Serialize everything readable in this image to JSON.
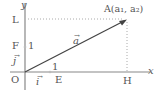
{
  "diagram": {
    "type": "coordinate-plane-vector",
    "axes": {
      "x_label": "x",
      "y_label": "y",
      "origin_label": "O",
      "axis_color": "#888888"
    },
    "points": {
      "L": "L",
      "F": "F",
      "E": "E",
      "H": "H",
      "A": "A(a₁, a₂)"
    },
    "unit_labels": {
      "y_unit": "1",
      "x_unit": "1"
    },
    "vectors": {
      "a": "a",
      "i": "i",
      "j": "j",
      "arrow_glyph": "→"
    },
    "colors": {
      "vector_line": "#444444",
      "dotted_guide": "#aaaaaa",
      "text": "#555555"
    }
  }
}
